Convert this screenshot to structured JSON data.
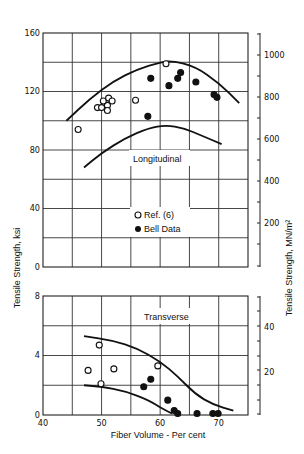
{
  "chart_data": [
    {
      "type": "scatter",
      "panel": "Longitudinal",
      "title": "Longitudinal",
      "xlabel": "Fiber Volume - Per cent",
      "ylabel": "Tensile Strength, ksi",
      "ylabel_right": "Tensile Strength, MN/m²",
      "xlim": [
        40,
        75
      ],
      "ylim": [
        0,
        160
      ],
      "ylim_right_ticks": [
        200,
        400,
        600,
        800,
        1000
      ],
      "yticks": [
        0,
        40,
        80,
        120,
        160
      ],
      "grid": true,
      "legend": {
        "position": "inside-center",
        "entries": [
          "Ref. (6)",
          "Bell Data"
        ]
      },
      "series": [
        {
          "name": "Ref. (6)",
          "marker": "open-circle",
          "points": [
            [
              46,
              94
            ],
            [
              49.3,
              109
            ],
            [
              50,
              109
            ],
            [
              51,
              110.5
            ],
            [
              50.3,
              113.5
            ],
            [
              51.2,
              115.5
            ],
            [
              51.8,
              113.5
            ],
            [
              51,
              107
            ],
            [
              55.8,
              114
            ],
            [
              61,
              139
            ]
          ]
        },
        {
          "name": "Bell Data",
          "marker": "filled-circle",
          "points": [
            [
              58.4,
              129
            ],
            [
              57.9,
              103
            ],
            [
              61.5,
              124
            ],
            [
              63,
              129
            ],
            [
              63.5,
              133
            ],
            [
              66.1,
              126.5
            ],
            [
              69.2,
              118
            ],
            [
              69.7,
              116
            ]
          ]
        }
      ],
      "bounds": {
        "upper": [
          [
            44,
            100
          ],
          [
            48,
            115
          ],
          [
            52,
            127
          ],
          [
            56,
            135
          ],
          [
            60,
            140
          ],
          [
            62,
            141
          ],
          [
            66,
            137
          ],
          [
            70,
            126
          ],
          [
            73.5,
            112
          ]
        ],
        "lower": [
          [
            47,
            68
          ],
          [
            50,
            78
          ],
          [
            54,
            88
          ],
          [
            58,
            95
          ],
          [
            61,
            97
          ],
          [
            64,
            95
          ],
          [
            67,
            90
          ],
          [
            70.5,
            84
          ]
        ]
      }
    },
    {
      "type": "scatter",
      "panel": "Transverse",
      "title": "Transverse",
      "xlabel": "Fiber Volume - Per cent",
      "ylabel": "Tensile Strength, ksi",
      "ylabel_right": "Tensile Strength, MN/m²",
      "xlim": [
        40,
        75
      ],
      "ylim": [
        0,
        8
      ],
      "yticks": [
        0,
        4,
        8
      ],
      "ylim_right_ticks": [
        20,
        40
      ],
      "xticks": [
        40,
        50,
        60,
        70
      ],
      "grid": true,
      "series": [
        {
          "name": "Ref. (6)",
          "marker": "open-circle",
          "points": [
            [
              47.7,
              3.0
            ],
            [
              49.6,
              4.7
            ],
            [
              49.9,
              2.1
            ],
            [
              52.1,
              3.1
            ],
            [
              59.6,
              3.3
            ]
          ]
        },
        {
          "name": "Bell Data",
          "marker": "filled-circle",
          "points": [
            [
              58.4,
              2.4
            ],
            [
              57.2,
              1.9
            ],
            [
              61.3,
              1.0
            ],
            [
              62.4,
              0.3
            ],
            [
              63,
              0.1
            ],
            [
              66.3,
              0.1
            ],
            [
              69,
              0.1
            ],
            [
              69.9,
              0.1
            ]
          ]
        }
      ],
      "bounds": {
        "upper": [
          [
            47,
            5.3
          ],
          [
            52,
            5.0
          ],
          [
            56,
            4.5
          ],
          [
            60,
            3.6
          ],
          [
            63,
            2.6
          ],
          [
            66,
            1.4
          ],
          [
            69,
            0.7
          ],
          [
            72.5,
            0.3
          ]
        ],
        "lower": [
          [
            47,
            2.0
          ],
          [
            50,
            1.9
          ],
          [
            54,
            1.6
          ],
          [
            58,
            1.0
          ],
          [
            60,
            0.5
          ],
          [
            62,
            0.1
          ]
        ]
      }
    }
  ],
  "labels": {
    "y_left": "Tensile Strength,  ksi",
    "y_right": "Tensile Strength,  MN/m²",
    "x": "Fiber Volume - Per cent",
    "longitudinal": "Longitudinal",
    "transverse": "Transverse",
    "legend_ref": "Ref. (6)",
    "legend_bell": "Bell Data"
  },
  "ticks": {
    "upper_left": [
      "160",
      "120",
      "80",
      "40",
      "0"
    ],
    "upper_right": [
      "1000",
      "800",
      "600",
      "400",
      "200"
    ],
    "lower_left": [
      "8",
      "4",
      "0"
    ],
    "lower_right": [
      "40",
      "20"
    ],
    "x": [
      "40",
      "50",
      "60",
      "70"
    ]
  }
}
